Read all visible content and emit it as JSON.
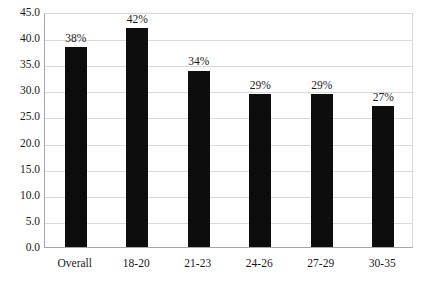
{
  "chart_data": {
    "type": "bar",
    "title": "",
    "subtitle": "",
    "xlabel": "",
    "ylabel": "",
    "categories": [
      "Overall",
      "18-20",
      "21-23",
      "24-26",
      "27-29",
      "30-35"
    ],
    "values": [
      38.3,
      42.0,
      33.8,
      29.3,
      29.3,
      27.0
    ],
    "data_labels": [
      "38%",
      "42%",
      "34%",
      "29%",
      "29%",
      "27%"
    ],
    "series": [
      {
        "name": "",
        "values": [
          38.3,
          42.0,
          33.8,
          29.3,
          29.3,
          27.0
        ]
      }
    ],
    "ylim": [
      0.0,
      45.0
    ],
    "ytick_step": 5.0,
    "ytick_labels": [
      "0.0",
      "5.0",
      "10.0",
      "15.0",
      "20.0",
      "25.0",
      "30.0",
      "35.0",
      "40.0",
      "45.0"
    ],
    "ytick_values": [
      0.0,
      5.0,
      10.0,
      15.0,
      20.0,
      25.0,
      30.0,
      35.0,
      40.0,
      45.0
    ],
    "grid": true,
    "grid_axis": "y",
    "legend": false,
    "legend_position": "none",
    "bar_color": "#0d0d0d",
    "grid_color": "#d9d9d9",
    "axis_color": "#a6a6a6",
    "background_color": "#ffffff",
    "text_color": "#1a1a1a"
  }
}
